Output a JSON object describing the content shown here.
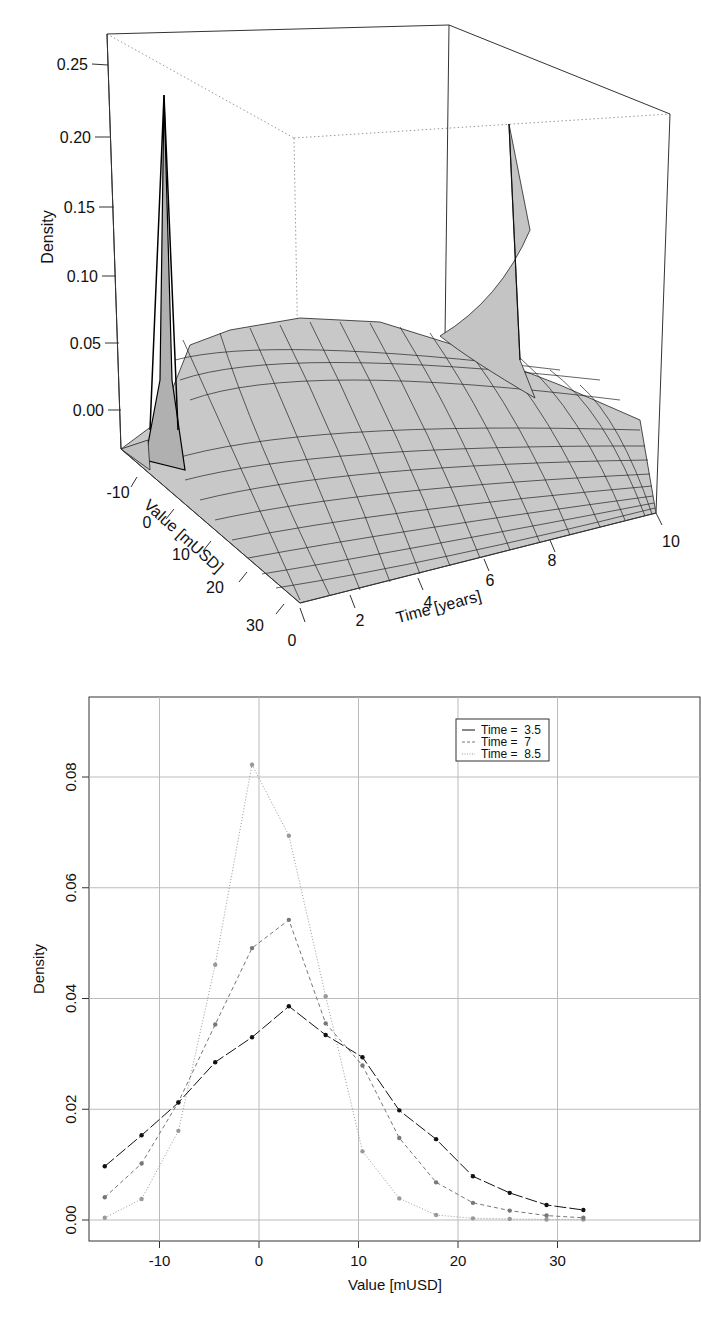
{
  "chart_data": [
    {
      "type": "surface3d",
      "title": "",
      "xlabel": "Value [mUSD]",
      "ylabel": "Time [years]",
      "zlabel": "Density",
      "x_ticks": [
        "-10",
        "0",
        "10",
        "20",
        "30"
      ],
      "y_ticks": [
        "0",
        "2",
        "4",
        "6",
        "8",
        "10"
      ],
      "z_ticks": [
        "0.00",
        "0.05",
        "0.10",
        "0.15",
        "0.20",
        "0.25"
      ],
      "zlim": [
        0,
        0.27
      ],
      "description": "Gray wireframe density surface: sharp spike (~0.25) near Value≈-5 at Time≈0, spreading out over time; second spike (~0.19) at far corner Time=10 near low Value.",
      "grid": false
    },
    {
      "type": "line",
      "title": "",
      "xlabel": "Value [mUSD]",
      "ylabel": "Density",
      "xlim": [
        -17,
        36
      ],
      "ylim": [
        -0.003,
        0.093
      ],
      "x_ticks": [
        -10,
        0,
        10,
        20,
        30
      ],
      "y_ticks": [
        0.0,
        0.02,
        0.04,
        0.06,
        0.08
      ],
      "grid": true,
      "legend_position": "top-right",
      "x": [
        -15.5,
        -11.8,
        -8.1,
        -4.4,
        -0.7,
        3.0,
        6.7,
        10.4,
        14.1,
        17.8,
        21.5,
        25.2,
        28.9,
        32.6
      ],
      "series": [
        {
          "name": "Time =  3.5",
          "style": "solid",
          "color": "#111111",
          "values": [
            0.0097,
            0.0153,
            0.0212,
            0.0285,
            0.033,
            0.0386,
            0.0334,
            0.0294,
            0.0198,
            0.0146,
            0.0079,
            0.0049,
            0.0027,
            0.0018
          ]
        },
        {
          "name": "Time =  7",
          "style": "dashed",
          "color": "#777777",
          "values": [
            0.0041,
            0.0102,
            0.0213,
            0.0353,
            0.0491,
            0.0542,
            0.0355,
            0.0279,
            0.0148,
            0.0068,
            0.0031,
            0.0017,
            0.0008,
            0.0004
          ]
        },
        {
          "name": "Time =  8.5",
          "style": "dotted",
          "color": "#999999",
          "values": [
            0.0004,
            0.0038,
            0.0161,
            0.0461,
            0.0822,
            0.0694,
            0.0404,
            0.0124,
            0.0039,
            0.0009,
            0.0003,
            0.0002,
            0.0001,
            0.0001
          ]
        }
      ]
    }
  ],
  "top": {
    "zlabel": "Density",
    "xlabel": "Value [mUSD]",
    "ylabel": "Time [years]",
    "z_ticks": [
      "0.00",
      "0.05",
      "0.10",
      "0.15",
      "0.20",
      "0.25"
    ],
    "x_ticks": [
      "-10",
      "0",
      "10",
      "20",
      "30"
    ],
    "y_ticks": [
      "0",
      "2",
      "4",
      "6",
      "8",
      "10"
    ]
  },
  "bottom": {
    "xlabel": "Value [mUSD]",
    "ylabel": "Density",
    "x_ticks": [
      "-10",
      "0",
      "10",
      "20",
      "30"
    ],
    "y_ticks": [
      "0.00",
      "0.02",
      "0.04",
      "0.06",
      "0.08"
    ],
    "legend": [
      "Time =  3.5",
      "Time =  7",
      "Time =  8.5"
    ]
  }
}
